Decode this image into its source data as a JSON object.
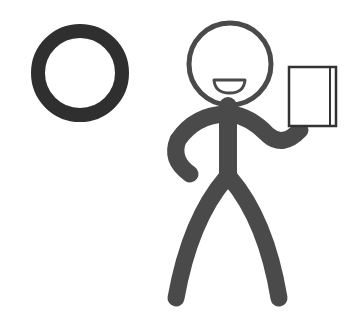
{
  "scene": {
    "description": "Stick figure smiling and holding up a book next to a large dark ring",
    "colors": {
      "background": "#ffffff",
      "ring": "#2f2f2f",
      "figure": "#4a4a4a",
      "book_fill": "#ffffff",
      "book_stroke": "#333333"
    },
    "elements": [
      {
        "name": "ring-icon",
        "label": "circle / letter O"
      },
      {
        "name": "stick-figure",
        "label": "person"
      },
      {
        "name": "book-icon",
        "label": "book"
      }
    ]
  }
}
